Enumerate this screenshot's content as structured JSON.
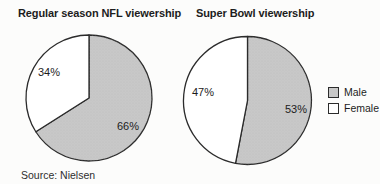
{
  "figure": {
    "source_note": "Source: Nielsen"
  },
  "legend": {
    "position": "right",
    "items": [
      {
        "label": "Male",
        "color": "#c8c8c8"
      },
      {
        "label": "Female",
        "color": "#ffffff"
      }
    ]
  },
  "style": {
    "outline_color": "#2b2b2b",
    "stipple_dot_color": "#b0b0b0"
  },
  "chart_data": [
    {
      "type": "pie",
      "title": "Regular season NFL viewership",
      "start_angle_deg": 0,
      "direction": "clockwise",
      "slices": [
        {
          "name": "Male",
          "value": 66,
          "label": "66%",
          "color": "#c8c8c8"
        },
        {
          "name": "Female",
          "value": 34,
          "label": "34%",
          "color": "#ffffff"
        }
      ]
    },
    {
      "type": "pie",
      "title": "Super Bowl viewership",
      "start_angle_deg": 0,
      "direction": "clockwise",
      "slices": [
        {
          "name": "Male",
          "value": 53,
          "label": "53%",
          "color": "#c8c8c8"
        },
        {
          "name": "Female",
          "value": 47,
          "label": "47%",
          "color": "#ffffff"
        }
      ]
    }
  ]
}
